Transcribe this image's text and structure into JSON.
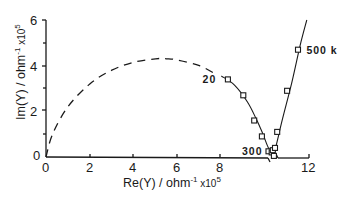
{
  "chart_data": {
    "type": "scatter",
    "title": "",
    "xlabel": "Re(Y) / ohm⁻¹ x10⁵",
    "ylabel": "Im(Y) / ohm⁻¹ x10⁵",
    "xlim": [
      0,
      12.5
    ],
    "ylim": [
      0,
      6
    ],
    "x_ticks": [
      0,
      2,
      4,
      6,
      8,
      12
    ],
    "x_tick_labels": [
      "0",
      "2",
      "4",
      "6",
      "8",
      "12"
    ],
    "y_ticks": [
      0,
      2,
      4,
      6
    ],
    "y_tick_labels": [
      "0",
      "2",
      "4",
      "6"
    ],
    "x_axis_break": [
      9.9,
      10.6
    ],
    "grid": false,
    "legend": null,
    "series": [
      {
        "name": "measured",
        "marker": "open-square",
        "x": [
          8.3,
          9.0,
          9.5,
          9.85,
          10.15,
          10.3,
          10.35,
          10.4,
          10.45,
          10.55,
          11.0,
          11.5
        ],
        "y": [
          3.4,
          2.7,
          1.6,
          0.9,
          0.25,
          0.2,
          0.3,
          0.05,
          0.4,
          1.1,
          2.9,
          4.7
        ]
      },
      {
        "name": "fit (solid)",
        "style": "solid-line",
        "x": [
          8.0,
          8.6,
          9.2,
          9.6,
          9.9,
          10.1,
          10.3,
          10.35,
          10.5,
          10.8,
          11.2,
          11.6,
          11.9
        ],
        "y": [
          3.55,
          3.15,
          2.4,
          1.65,
          1.0,
          0.5,
          0.1,
          0.0,
          0.5,
          1.7,
          3.2,
          4.9,
          6.0
        ]
      },
      {
        "name": "extrapolated semicircle (dashed)",
        "style": "dashed-line",
        "x": [
          0.0,
          0.3,
          1.0,
          2.0,
          3.0,
          4.0,
          5.0,
          5.5,
          6.0,
          7.0,
          7.8
        ],
        "y": [
          0.0,
          1.0,
          2.2,
          3.2,
          3.8,
          4.15,
          4.3,
          4.3,
          4.25,
          4.0,
          3.6
        ]
      }
    ],
    "annotations": [
      {
        "text": "20",
        "x": 7.6,
        "y": 3.4
      },
      {
        "text": "300",
        "x": 9.4,
        "y": 0.25
      },
      {
        "text": "500 k",
        "x": 11.7,
        "y": 4.7
      }
    ]
  },
  "labels": {
    "x_title_main": "Re(Y) / ohm",
    "x_title_exp": "-1",
    "x_title_mult": " x10",
    "x_title_pow": "5",
    "y_title_main": "Im(Y) / ohm",
    "y_title_exp": "-1",
    "y_title_mult": " x10",
    "y_title_pow": "5",
    "origin_y": "0"
  }
}
